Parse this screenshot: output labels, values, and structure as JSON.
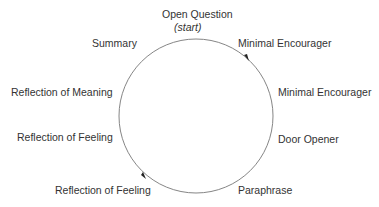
{
  "diagram": {
    "type": "cycle",
    "nodes": [
      {
        "label": "Open Question",
        "sub": "(start)"
      },
      {
        "label": "Minimal Encourager"
      },
      {
        "label": "Minimal Encourager"
      },
      {
        "label": "Door Opener"
      },
      {
        "label": "Paraphrase"
      },
      {
        "label": "Reflection of Feeling"
      },
      {
        "label": "Reflection of Feeling"
      },
      {
        "label": "Reflection of Meaning"
      },
      {
        "label": "Summary"
      }
    ],
    "circle": {
      "cx": 196,
      "cy": 116,
      "r": 77,
      "stroke": "#777777"
    },
    "direction": "clockwise"
  }
}
